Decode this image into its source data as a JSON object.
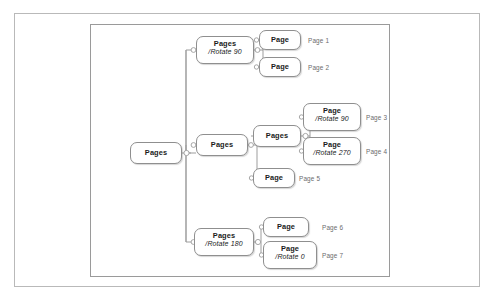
{
  "diagram": {
    "type": "tree",
    "title_visible": false,
    "frame": {
      "outer_border_color": "#b9b9b9",
      "inner_border_color": "#9a9a9a",
      "background": "#ffffff"
    },
    "node_style": {
      "border_color": "#8f8f8f",
      "fill": "#ffffff",
      "text_color": "#1b1b1b"
    },
    "connector_color": "#9d9d9d",
    "nodes": [
      {
        "id": "root",
        "label": "Pages",
        "sub": "",
        "x": 130,
        "y": 142,
        "w": 52,
        "h": 22
      },
      {
        "id": "br_top",
        "label": "Pages",
        "sub": "/Rotate 90",
        "x": 196,
        "y": 36,
        "w": 58,
        "h": 28
      },
      {
        "id": "br_mid",
        "label": "Pages",
        "sub": "",
        "x": 196,
        "y": 134,
        "w": 52,
        "h": 22
      },
      {
        "id": "br_bot",
        "label": "Pages",
        "sub": "/Rotate 180",
        "x": 194,
        "y": 228,
        "w": 60,
        "h": 28
      },
      {
        "id": "leaf1",
        "label": "Page",
        "sub": "",
        "x": 259,
        "y": 30,
        "w": 42,
        "h": 20
      },
      {
        "id": "leaf2",
        "label": "Page",
        "sub": "",
        "x": 259,
        "y": 57,
        "w": 42,
        "h": 20
      },
      {
        "id": "mid_sub",
        "label": "Pages",
        "sub": "",
        "x": 253,
        "y": 125,
        "w": 48,
        "h": 22
      },
      {
        "id": "leaf3",
        "label": "Page",
        "sub": "/Rotate 90",
        "x": 303,
        "y": 103,
        "w": 58,
        "h": 28
      },
      {
        "id": "leaf4",
        "label": "Page",
        "sub": "/Rotate 270",
        "x": 303,
        "y": 137,
        "w": 58,
        "h": 28
      },
      {
        "id": "leaf5",
        "label": "Page",
        "sub": "",
        "x": 253,
        "y": 168,
        "w": 42,
        "h": 20
      },
      {
        "id": "leaf6",
        "label": "Page",
        "sub": "",
        "x": 263,
        "y": 217,
        "w": 46,
        "h": 20
      },
      {
        "id": "leaf7",
        "label": "Page",
        "sub": "/Rotate 0",
        "x": 263,
        "y": 241,
        "w": 54,
        "h": 28
      }
    ],
    "captions": [
      {
        "id": "cap1",
        "text": "Page 1",
        "x": 308,
        "y": 37
      },
      {
        "id": "cap2",
        "text": "Page 2",
        "x": 308,
        "y": 64
      },
      {
        "id": "cap3",
        "text": "Page 3",
        "x": 366,
        "y": 114
      },
      {
        "id": "cap4",
        "text": "Page 4",
        "x": 366,
        "y": 148
      },
      {
        "id": "cap5",
        "text": "Page 5",
        "x": 299,
        "y": 175
      },
      {
        "id": "cap6",
        "text": "Page 6",
        "x": 322,
        "y": 224
      },
      {
        "id": "cap7",
        "text": "Page 7",
        "x": 322,
        "y": 252
      }
    ]
  }
}
